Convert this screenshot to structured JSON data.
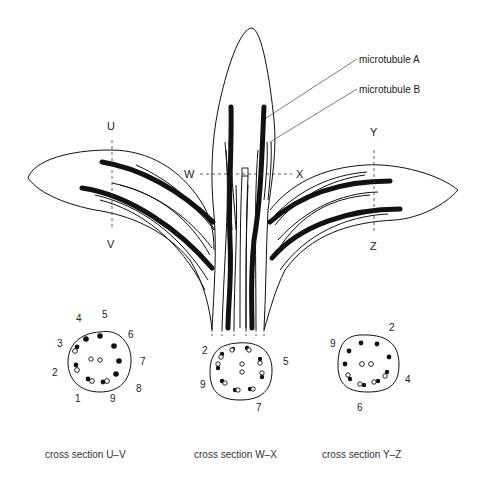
{
  "labels": {
    "microtubule_a": "microtubule A",
    "microtubule_b": "microtubule B",
    "U": "U",
    "V": "V",
    "W": "W",
    "X": "X",
    "Y": "Y",
    "Z": "Z"
  },
  "cross_sections": [
    {
      "id": "uv",
      "caption": "cross section U–V",
      "numbers": [
        "1",
        "2",
        "3",
        "4",
        "5",
        "6",
        "7",
        "8",
        "9"
      ]
    },
    {
      "id": "wx",
      "caption": "cross section W–X",
      "numbers": [
        "2",
        "5",
        "7",
        "9"
      ]
    },
    {
      "id": "yz",
      "caption": "cross section Y–Z",
      "numbers": [
        "2",
        "4",
        "6",
        "9"
      ]
    }
  ],
  "colors": {
    "ink": "#111111",
    "background": "#ffffff"
  }
}
